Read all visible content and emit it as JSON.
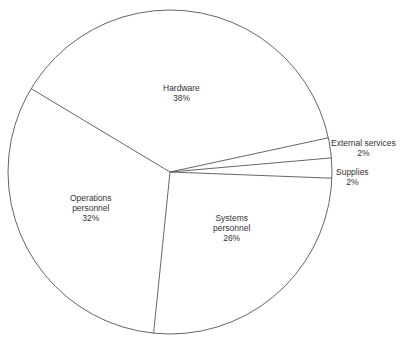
{
  "chart_data": {
    "type": "pie",
    "title": "",
    "categories": [
      "Hardware",
      "External services",
      "Supplies",
      "Systems personnel",
      "Operations personnel"
    ],
    "values": [
      38,
      2,
      2,
      26,
      32
    ],
    "unit": "%",
    "slices": [
      {
        "name": "Hardware",
        "line1": "Hardware",
        "line2": "",
        "pct": "38%",
        "value": 38
      },
      {
        "name": "External services",
        "line1": "External services",
        "line2": "",
        "pct": "2%",
        "value": 2
      },
      {
        "name": "Supplies",
        "line1": "Supplies",
        "line2": "",
        "pct": "2%",
        "value": 2
      },
      {
        "name": "Systems personnel",
        "line1": "Systems",
        "line2": "personnel",
        "pct": "26%",
        "value": 26
      },
      {
        "name": "Operations personnel",
        "line1": "Operations",
        "line2": "personnel",
        "pct": "32%",
        "value": 32
      }
    ],
    "legend": "none (labels placed on/near slices)",
    "colors": {
      "stroke": "#555555",
      "fill": "#ffffff",
      "text": "#333333"
    }
  }
}
